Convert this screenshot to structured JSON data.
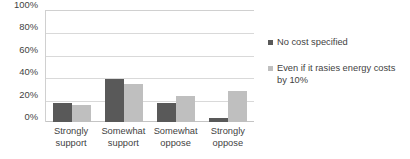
{
  "chart_data": {
    "type": "bar",
    "title": "SUPPORT FOR RENEWABLE ENERGY STANDARD",
    "title_clipped": true,
    "categories": [
      "Strongly support",
      "Somewhat support",
      "Somewhat oppose",
      "Strongly oppose"
    ],
    "series": [
      {
        "name": "No cost specified",
        "color": "#595959",
        "values": [
          17,
          38,
          17,
          4
        ]
      },
      {
        "name": "Even if it rasies energy costs by 10%",
        "color": "#bfbfbf",
        "values": [
          15,
          34,
          23,
          28
        ]
      }
    ],
    "xlabel": "",
    "ylabel": "",
    "ylim": [
      0,
      100
    ],
    "ytick_labels": [
      "0%",
      "20%",
      "40%",
      "60%",
      "80%",
      "100%"
    ],
    "ytick_values": [
      0,
      20,
      40,
      60,
      80,
      100
    ],
    "grid": true,
    "legend_position": "right"
  },
  "colors": {
    "series_dark": "#595959",
    "series_light": "#bfbfbf",
    "gridline": "#d9d9d9",
    "text": "#3f3f3f",
    "background": "#ffffff"
  }
}
